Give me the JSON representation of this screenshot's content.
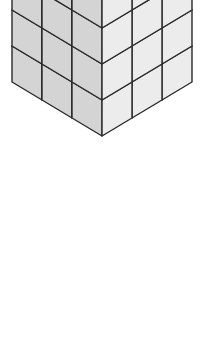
{
  "figure": {
    "unit": {
      "half_width": 30,
      "rise": 18,
      "height": 36
    },
    "colors": {
      "top": "#ffffff",
      "left": "#d4d4d4",
      "right": "#ececec",
      "edge": "#2a2a2a"
    }
  }
}
